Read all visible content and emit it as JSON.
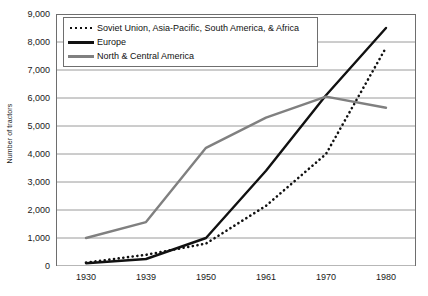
{
  "chart_data": {
    "type": "line",
    "title": "",
    "xlabel": "",
    "ylabel": "Number of tractors",
    "categories": [
      "1930",
      "1939",
      "1950",
      "1961",
      "1970",
      "1980"
    ],
    "ylim": [
      0,
      9000
    ],
    "ytick_step": 1000,
    "yticks": [
      "0",
      "1,000",
      "2,000",
      "3,000",
      "4,000",
      "5,000",
      "6,000",
      "7,000",
      "8,000",
      "9,000"
    ],
    "grid": "horizontal",
    "legend_position": "top-left-inside",
    "series": [
      {
        "name": "Soviet Union, Asia-Pacific, South America, & Africa",
        "style": "dotted",
        "color": "#111111",
        "values": [
          120,
          400,
          800,
          2150,
          4000,
          7800
        ]
      },
      {
        "name": "Europe",
        "style": "solid",
        "color": "#111111",
        "values": [
          100,
          250,
          1000,
          3400,
          6100,
          8500
        ]
      },
      {
        "name": "North & Central America",
        "style": "solid",
        "color": "#808080",
        "values": [
          1000,
          1570,
          4220,
          5300,
          6050,
          5650
        ]
      }
    ]
  },
  "axis": {
    "y_title": "Number of tractors"
  }
}
